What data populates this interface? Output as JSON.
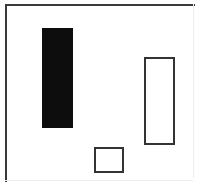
{
  "figure": {
    "canvas": {
      "width": 201,
      "height": 186,
      "background_color": "#ffffff"
    },
    "frame": {
      "label": "outer border frame",
      "stroke_color_primary": "#3a3a3a",
      "stroke_color_faint": "#ededed",
      "left": 5,
      "top": 4,
      "width": 190,
      "height": 178,
      "stroke_width": 2
    },
    "shapes": [
      {
        "name": "filled-bar",
        "label": "Large black filled rectangle",
        "fill": "solid",
        "fill_color": "#0d0d0d",
        "stroke_color": "#0d0d0d",
        "x": 42,
        "y": 28,
        "width": 31,
        "height": 100
      },
      {
        "name": "outlined-bar",
        "label": "Tall white outlined rectangle",
        "fill": "none",
        "fill_color": "#ffffff",
        "stroke_color": "#333333",
        "stroke_width": 2,
        "x": 144,
        "y": 57,
        "width": 31,
        "height": 88
      },
      {
        "name": "outlined-square",
        "label": "Small white outlined square",
        "fill": "none",
        "fill_color": "#ffffff",
        "stroke_color": "#333333",
        "stroke_width": 2,
        "x": 94,
        "y": 147,
        "width": 30,
        "height": 26
      }
    ]
  }
}
